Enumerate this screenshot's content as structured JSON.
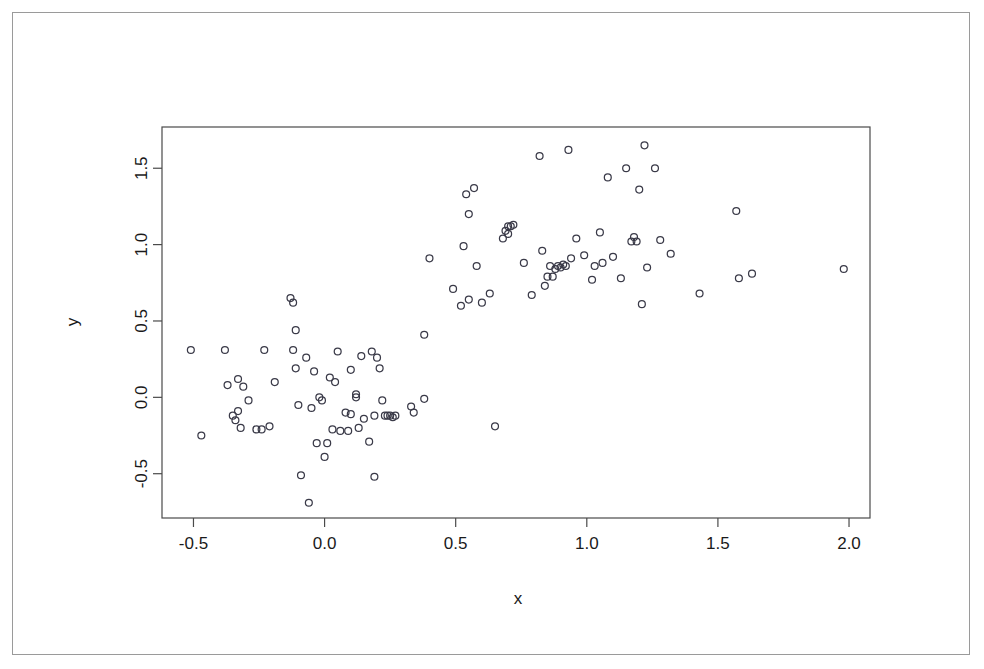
{
  "figure": {
    "background_color": "#ffffff",
    "border_color": "#9a9a9a",
    "point_color": "#3a3a48",
    "axis_color": "#4a4a4a"
  },
  "chart_data": {
    "type": "scatter",
    "title": "",
    "xlabel": "x",
    "ylabel": "y",
    "grid": false,
    "legend": null,
    "xlim": [
      -0.62,
      2.08
    ],
    "ylim": [
      -0.79,
      1.77
    ],
    "xticks": [
      -0.5,
      0.0,
      0.5,
      1.0,
      1.5,
      2.0
    ],
    "xticklabels": [
      "-0.5",
      "0.0",
      "0.5",
      "1.0",
      "1.5",
      "2.0"
    ],
    "yticks": [
      -0.5,
      0.0,
      0.5,
      1.0,
      1.5
    ],
    "yticklabels": [
      "-0.5",
      "0.0",
      "0.5",
      "1.0",
      "1.5"
    ],
    "marker": "open-circle",
    "marker_size": 5,
    "n_points": 120,
    "points": [
      [
        -0.51,
        0.31
      ],
      [
        -0.47,
        -0.25
      ],
      [
        -0.38,
        0.31
      ],
      [
        -0.37,
        0.08
      ],
      [
        -0.35,
        -0.12
      ],
      [
        -0.34,
        -0.15
      ],
      [
        -0.33,
        -0.09
      ],
      [
        -0.33,
        0.12
      ],
      [
        -0.32,
        -0.2
      ],
      [
        -0.31,
        0.07
      ],
      [
        -0.29,
        -0.02
      ],
      [
        -0.26,
        -0.21
      ],
      [
        -0.24,
        -0.21
      ],
      [
        -0.23,
        0.31
      ],
      [
        -0.21,
        -0.19
      ],
      [
        -0.19,
        0.1
      ],
      [
        -0.13,
        0.65
      ],
      [
        -0.12,
        0.62
      ],
      [
        -0.12,
        0.31
      ],
      [
        -0.11,
        0.44
      ],
      [
        -0.11,
        0.19
      ],
      [
        -0.1,
        -0.05
      ],
      [
        -0.09,
        -0.51
      ],
      [
        -0.07,
        0.26
      ],
      [
        -0.06,
        -0.69
      ],
      [
        -0.05,
        -0.07
      ],
      [
        -0.04,
        0.17
      ],
      [
        -0.03,
        -0.3
      ],
      [
        -0.02,
        0.0
      ],
      [
        -0.01,
        -0.02
      ],
      [
        0.0,
        -0.39
      ],
      [
        0.01,
        -0.3
      ],
      [
        0.02,
        0.13
      ],
      [
        0.03,
        -0.21
      ],
      [
        0.04,
        0.1
      ],
      [
        0.05,
        0.3
      ],
      [
        0.06,
        -0.22
      ],
      [
        0.08,
        -0.1
      ],
      [
        0.09,
        -0.22
      ],
      [
        0.1,
        0.18
      ],
      [
        0.1,
        -0.11
      ],
      [
        0.12,
        0.02
      ],
      [
        0.12,
        0.0
      ],
      [
        0.13,
        -0.2
      ],
      [
        0.14,
        0.27
      ],
      [
        0.15,
        -0.14
      ],
      [
        0.17,
        -0.29
      ],
      [
        0.18,
        0.3
      ],
      [
        0.19,
        -0.12
      ],
      [
        0.19,
        -0.52
      ],
      [
        0.2,
        0.26
      ],
      [
        0.21,
        0.19
      ],
      [
        0.22,
        -0.02
      ],
      [
        0.23,
        -0.12
      ],
      [
        0.24,
        -0.12
      ],
      [
        0.25,
        -0.12
      ],
      [
        0.26,
        -0.13
      ],
      [
        0.27,
        -0.12
      ],
      [
        0.33,
        -0.06
      ],
      [
        0.34,
        -0.1
      ],
      [
        0.38,
        0.41
      ],
      [
        0.38,
        -0.01
      ],
      [
        0.4,
        0.91
      ],
      [
        0.49,
        0.71
      ],
      [
        0.52,
        0.6
      ],
      [
        0.53,
        0.99
      ],
      [
        0.54,
        1.33
      ],
      [
        0.55,
        1.2
      ],
      [
        0.55,
        0.64
      ],
      [
        0.57,
        1.37
      ],
      [
        0.58,
        0.86
      ],
      [
        0.6,
        0.62
      ],
      [
        0.63,
        0.68
      ],
      [
        0.65,
        -0.19
      ],
      [
        0.68,
        1.04
      ],
      [
        0.69,
        1.09
      ],
      [
        0.7,
        1.07
      ],
      [
        0.7,
        1.12
      ],
      [
        0.71,
        1.12
      ],
      [
        0.72,
        1.13
      ],
      [
        0.76,
        0.88
      ],
      [
        0.79,
        0.67
      ],
      [
        0.82,
        1.58
      ],
      [
        0.83,
        0.96
      ],
      [
        0.84,
        0.73
      ],
      [
        0.85,
        0.79
      ],
      [
        0.86,
        0.86
      ],
      [
        0.87,
        0.79
      ],
      [
        0.88,
        0.84
      ],
      [
        0.89,
        0.86
      ],
      [
        0.9,
        0.85
      ],
      [
        0.91,
        0.87
      ],
      [
        0.92,
        0.86
      ],
      [
        0.93,
        1.62
      ],
      [
        0.94,
        0.91
      ],
      [
        0.96,
        1.04
      ],
      [
        0.99,
        0.93
      ],
      [
        1.02,
        0.77
      ],
      [
        1.03,
        0.86
      ],
      [
        1.05,
        1.08
      ],
      [
        1.06,
        0.88
      ],
      [
        1.08,
        1.44
      ],
      [
        1.1,
        0.92
      ],
      [
        1.13,
        0.78
      ],
      [
        1.15,
        1.5
      ],
      [
        1.17,
        1.02
      ],
      [
        1.18,
        1.05
      ],
      [
        1.19,
        1.02
      ],
      [
        1.2,
        1.36
      ],
      [
        1.21,
        0.61
      ],
      [
        1.22,
        1.65
      ],
      [
        1.23,
        0.85
      ],
      [
        1.26,
        1.5
      ],
      [
        1.28,
        1.03
      ],
      [
        1.32,
        0.94
      ],
      [
        1.43,
        0.68
      ],
      [
        1.57,
        1.22
      ],
      [
        1.58,
        0.78
      ],
      [
        1.63,
        0.81
      ],
      [
        1.98,
        0.84
      ]
    ]
  }
}
